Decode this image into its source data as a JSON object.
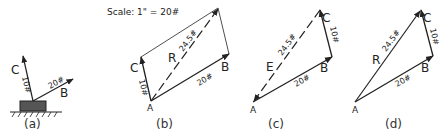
{
  "scale": {
    "label": "Scale: 1\" = 20#"
  },
  "panels": [
    {
      "caption": "(a)",
      "vectors": [
        {
          "name": "C",
          "magnitude": "10#"
        },
        {
          "name": "B",
          "magnitude": "20#"
        }
      ]
    },
    {
      "caption": "(b)",
      "origin": "A",
      "vectors": [
        {
          "name": "C",
          "magnitude": "10#"
        },
        {
          "name": "B",
          "magnitude": "20#"
        },
        {
          "name": "R",
          "magnitude": "24.5#"
        }
      ]
    },
    {
      "caption": "(c)",
      "origin": "A",
      "vectors": [
        {
          "name": "B",
          "magnitude": "20#"
        },
        {
          "name": "C",
          "magnitude": "10#"
        },
        {
          "name": "E",
          "magnitude": "24.5#"
        }
      ]
    },
    {
      "caption": "(d)",
      "origin": "A",
      "vectors": [
        {
          "name": "B",
          "magnitude": "20#"
        },
        {
          "name": "C",
          "magnitude": "10#"
        },
        {
          "name": "R",
          "magnitude": "24.5#"
        }
      ]
    }
  ],
  "colors": {
    "ink": "#222222",
    "block": "#555555"
  }
}
